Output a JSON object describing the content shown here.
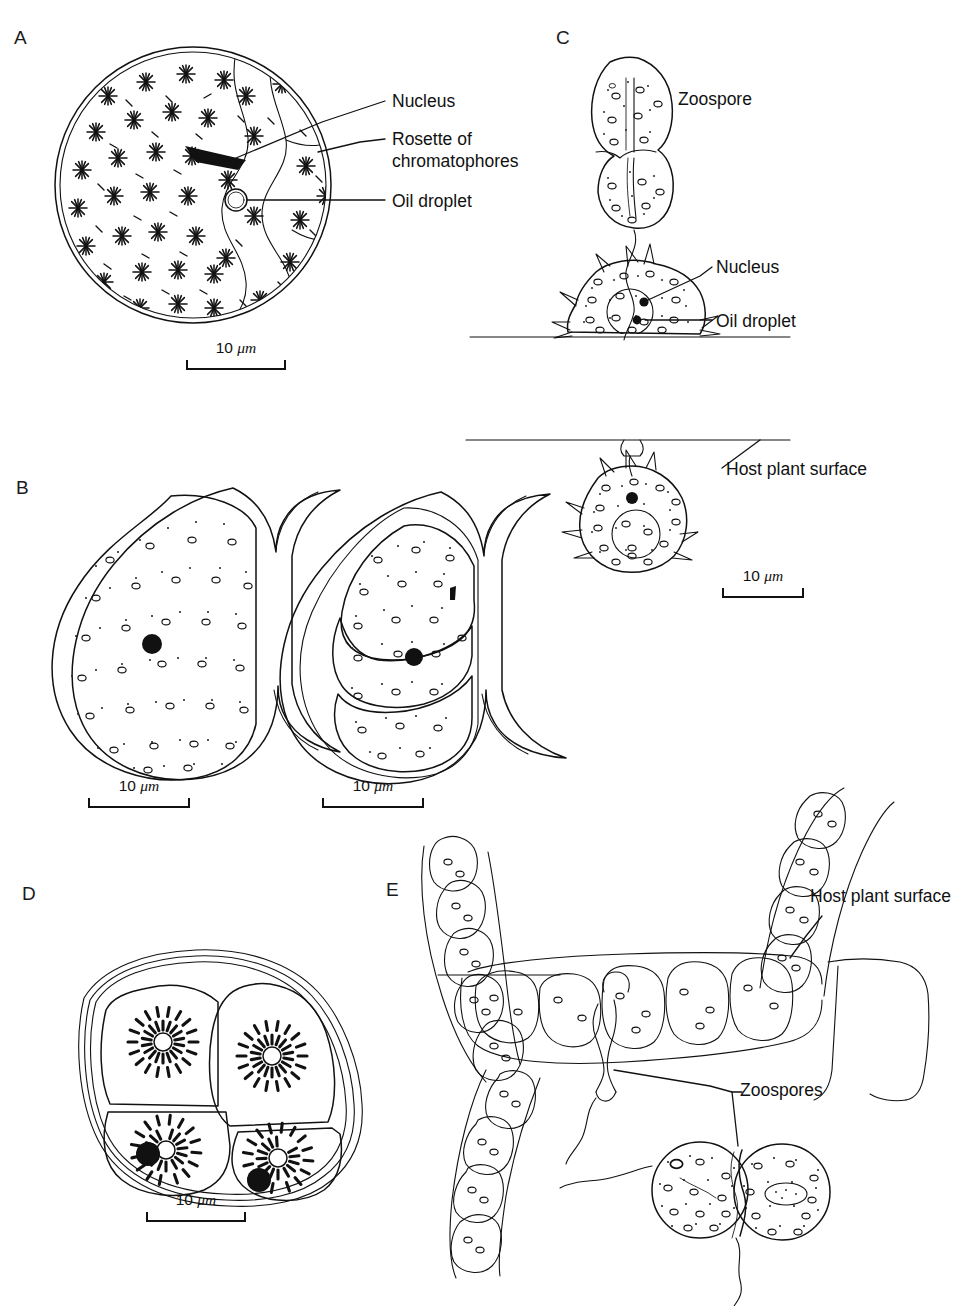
{
  "figure": {
    "type": "scientific-line-drawing",
    "background": "#ffffff",
    "ink_color": "#111111",
    "panels": [
      "A",
      "B",
      "C",
      "D",
      "E"
    ]
  },
  "panels": {
    "a": {
      "letter": "A",
      "labels": [
        {
          "text": "Nucleus"
        },
        {
          "text": "Rosette of"
        },
        {
          "text": "chromatophores"
        },
        {
          "text": "Oil droplet"
        }
      ],
      "scale": {
        "value": "10",
        "unit": "μm"
      }
    },
    "b": {
      "letter": "B",
      "scale_left": {
        "value": "10",
        "unit": "μm"
      },
      "scale_right": {
        "value": "10",
        "unit": "μm"
      }
    },
    "c": {
      "letter": "C",
      "labels": [
        {
          "text": "Zoospore"
        },
        {
          "text": "Nucleus"
        },
        {
          "text": "Oil droplet"
        },
        {
          "text": "Host plant surface"
        }
      ],
      "scale": {
        "value": "10",
        "unit": "μm"
      }
    },
    "d": {
      "letter": "D",
      "scale": {
        "value": "10",
        "unit": "μm"
      }
    },
    "e": {
      "letter": "E",
      "labels": [
        {
          "text": "Host plant surface"
        },
        {
          "text": "Zoospores"
        }
      ]
    }
  },
  "caption": {
    "text": ""
  }
}
